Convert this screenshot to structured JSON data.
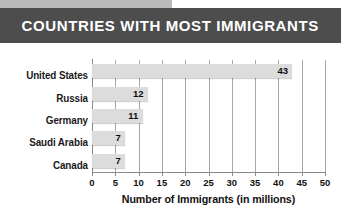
{
  "header": {
    "title": "COUNTRIES WITH MOST IMMIGRANTS",
    "bar_color": "#4d4d4d",
    "strip_color": "#b9b9b9",
    "title_color": "#ffffff"
  },
  "chart_data": {
    "type": "bar",
    "orientation": "horizontal",
    "title": "COUNTRIES WITH MOST IMMIGRANTS",
    "categories": [
      "United States",
      "Russia",
      "Germany",
      "Saudi Arabia",
      "Canada"
    ],
    "values": [
      43,
      12,
      11,
      7,
      7
    ],
    "value_labels": [
      "43",
      "12",
      "11",
      "7",
      "7"
    ],
    "xlabel": "Number of Immigrants (in millions)",
    "ylabel": "",
    "xlim": [
      0,
      50
    ],
    "xticks": [
      0,
      5,
      10,
      15,
      20,
      25,
      30,
      35,
      40,
      45,
      50
    ],
    "xtick_labels": [
      "0",
      "5",
      "10",
      "15",
      "20",
      "25",
      "30",
      "35",
      "40",
      "45",
      "50"
    ],
    "grid": "vertical",
    "legend": "none",
    "bar_color": "#dcdcdc",
    "gridline_color": "#a8a8a8",
    "axis_color": "#8a8a8a",
    "label_color": "#1a1a1a",
    "background": "#ffffff"
  }
}
